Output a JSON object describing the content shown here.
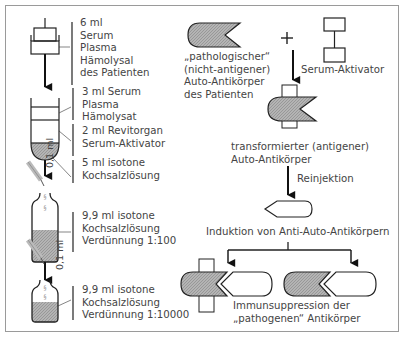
{
  "left_column": {
    "step1": {
      "lines": [
        "6 ml",
        "Serum",
        "Plasma",
        "Hämolysal",
        "des Patienten"
      ]
    },
    "step2a": {
      "lines": [
        "3 ml  Serum",
        "Plasma",
        "Hämolysat"
      ]
    },
    "step2b": {
      "lines": [
        "2 ml Revitorgan",
        "Serum-Aktivator"
      ]
    },
    "step2c": {
      "lines": [
        "5 ml isotone",
        "Kochsalzlösung"
      ]
    },
    "transfer1": "0,1 ml",
    "step3": {
      "lines": [
        "9,9 ml isotone",
        "Kochsalzlösung",
        "Verdünnung 1:100"
      ]
    },
    "transfer2": "0,1 ml",
    "step4": {
      "lines": [
        "9,9 ml isotone",
        "Kochsalzlösung",
        "Verdünnung 1:10000"
      ]
    }
  },
  "right_column": {
    "pathologic_antibody": {
      "lines": [
        "„pathologischer“",
        "(nicht-antigener)",
        "Auto-Antikörper",
        "des Patienten"
      ]
    },
    "plus": "+",
    "activator": "Serum-Aktivator",
    "transformed": {
      "lines": [
        "transformierter (antigener)",
        "Auto-Antikörper"
      ]
    },
    "reinjection": "Reinjektion",
    "induction": "Induktion von Anti-Auto-Antikörpern",
    "suppression": {
      "lines": [
        "Immunsuppression der",
        "„pathogenen“ Antikörper"
      ]
    }
  },
  "colors": {
    "stroke": "#1a1a1a",
    "fill_gray": "#a8a8a8",
    "frame": "#9a9a9a",
    "text": "#444444"
  }
}
